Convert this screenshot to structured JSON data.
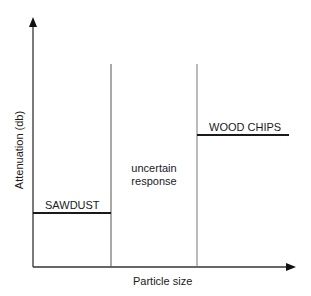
{
  "diagram": {
    "axes": {
      "y_label": "Attenuation (db)",
      "x_label": "Particle size"
    },
    "regions": [
      {
        "label": "SAWDUST",
        "level": "low"
      },
      {
        "label": "uncertain response",
        "level": "unknown"
      },
      {
        "label": "WOOD CHIPS",
        "level": "high"
      }
    ],
    "labels": {
      "sawdust": "SAWDUST",
      "uncertain_line1": "uncertain",
      "uncertain_line2": "response",
      "wood_chips": "WOOD CHIPS"
    },
    "colors": {
      "axis": "#333333",
      "divider": "#555555",
      "level_line": "#1a1a1a",
      "text": "#1a1a1a"
    }
  }
}
